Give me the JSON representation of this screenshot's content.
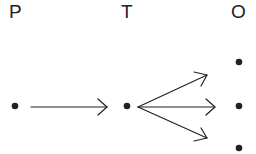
{
  "labels": {
    "p": "P",
    "t": "T",
    "o": "O"
  },
  "colors": {
    "ink": "#222222"
  },
  "nodes": [
    {
      "id": "p",
      "x": 15,
      "y": 106
    },
    {
      "id": "t",
      "x": 127,
      "y": 106
    },
    {
      "id": "o1",
      "x": 238,
      "y": 62
    },
    {
      "id": "o2",
      "x": 238,
      "y": 106
    },
    {
      "id": "o3",
      "x": 238,
      "y": 148
    }
  ],
  "edges": [
    {
      "from": "p",
      "to": "t"
    },
    {
      "from": "t",
      "to": "o1"
    },
    {
      "from": "t",
      "to": "o2"
    },
    {
      "from": "t",
      "to": "o3"
    }
  ]
}
